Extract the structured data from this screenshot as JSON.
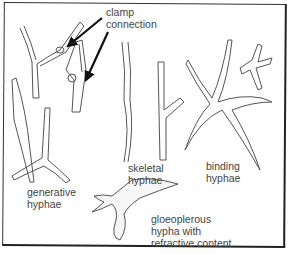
{
  "diagram": {
    "labels": {
      "clamp_connection": "clamp\nconnection",
      "generative_hyphae": "generative\nhyphae",
      "skeletal_hyphae": "skeletal\nhyphae",
      "binding_hyphae": "binding\nhyphae",
      "gloeoplerous_hypha": "gloeoplerous\nhypha with\nrefractive content"
    },
    "colors": {
      "line": "#555555",
      "text": "#444444",
      "arrow": "#111111",
      "border": "#333333"
    }
  }
}
